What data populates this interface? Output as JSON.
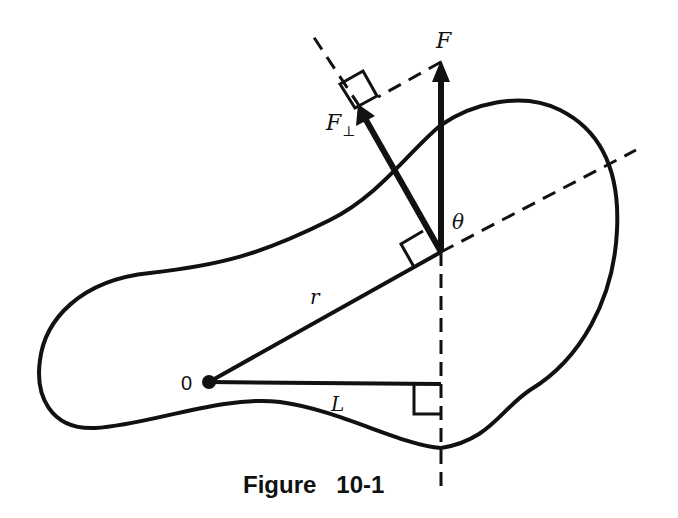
{
  "figure": {
    "caption": "Figure   10-1",
    "labels": {
      "force": "F",
      "force_perp_main": "F",
      "force_perp_sub": "⊥",
      "theta": "θ",
      "radius": "r",
      "lever_arm": "L",
      "origin": "0"
    },
    "colors": {
      "ink": "#111111",
      "background": "#ffffff"
    }
  }
}
